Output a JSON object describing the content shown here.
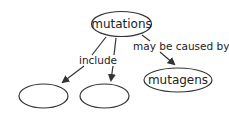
{
  "diagram": {
    "type": "concept-map",
    "nodes": [
      {
        "id": "mutations",
        "label": "mutations"
      },
      {
        "id": "mutagens",
        "label": "mutagens"
      },
      {
        "id": "blank1",
        "label": ""
      },
      {
        "id": "blank2",
        "label": ""
      }
    ],
    "edges": [
      {
        "from": "mutations",
        "to": "blank1",
        "label": "include"
      },
      {
        "from": "mutations",
        "to": "blank2",
        "label": "include"
      },
      {
        "from": "mutations",
        "to": "mutagens",
        "label": "may be caused by"
      }
    ],
    "labels": {
      "include": "include",
      "caused_by": "may be caused by"
    },
    "colors": {
      "stroke": "#333333",
      "text": "#222222",
      "background": "#ffffff"
    }
  }
}
